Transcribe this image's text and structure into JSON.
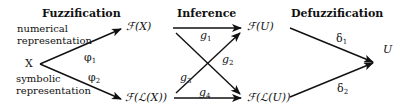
{
  "sections": {
    "fuzzification": "Fuzzification",
    "inference": "Inference",
    "defuzzification": "Defuzzification"
  },
  "inputs": {
    "source": "X",
    "numerical_line1": "numerical",
    "numerical_line2": "representation",
    "symbolic_line1": "symbolic",
    "symbolic_line2": "representation"
  },
  "nodes": {
    "fx": "ℱ(X)",
    "flx": "ℱ(ℒ(X))",
    "fu": "ℱ(U)",
    "flu": "ℱ(ℒ(U))",
    "u": "U"
  },
  "mappings": {
    "phi1": {
      "base": "φ",
      "sub": "1"
    },
    "phi2": {
      "base": "φ",
      "sub": "2"
    },
    "g1": {
      "base": "g",
      "sub": "1"
    },
    "g2": {
      "base": "g",
      "sub": "2"
    },
    "g3": {
      "base": "g",
      "sub": "3"
    },
    "g4": {
      "base": "g",
      "sub": "4"
    },
    "d1": {
      "base": "δ",
      "sub": "1"
    },
    "d2": {
      "base": "δ",
      "sub": "2"
    }
  },
  "colors": {
    "stroke": "#111111",
    "background": "#ffffff"
  }
}
